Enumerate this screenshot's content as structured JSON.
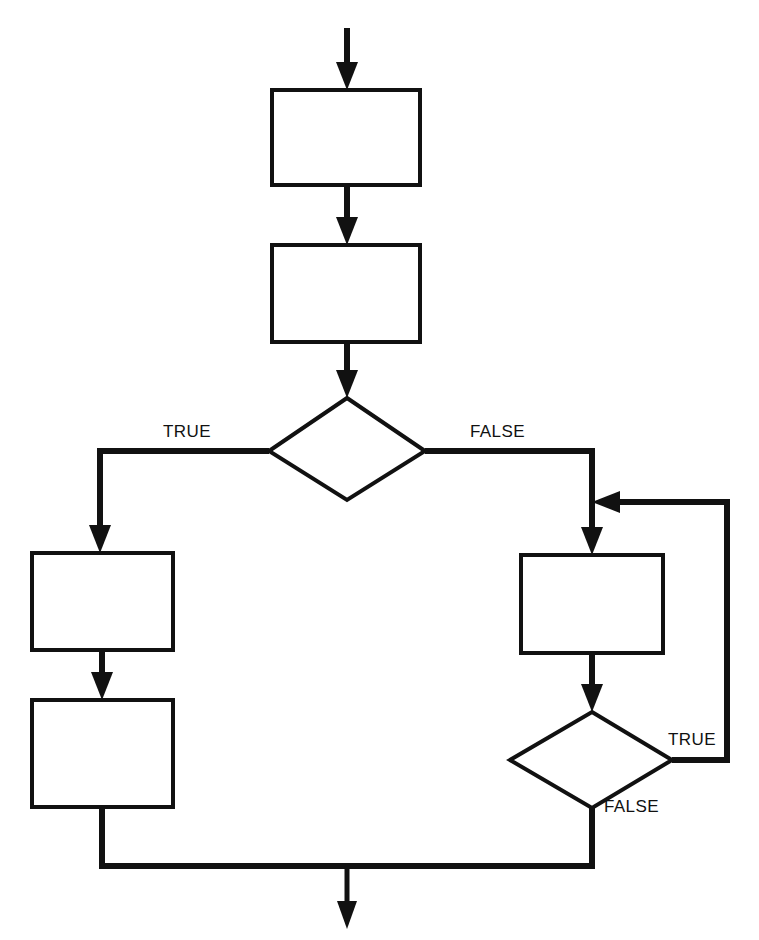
{
  "figure": {
    "kind": "flowchart",
    "title": "",
    "background_color": "#ffffff",
    "stroke_color": "#111111",
    "fill_color": "#ffffff",
    "width": 759,
    "height": 940
  },
  "nodes": [
    {
      "id": "process-1",
      "type": "process",
      "label": "",
      "x": 272,
      "y": 90,
      "w": 148,
      "h": 95
    },
    {
      "id": "process-2",
      "type": "process",
      "label": "",
      "x": 272,
      "y": 245,
      "w": 148,
      "h": 97
    },
    {
      "id": "decision-1",
      "type": "decision",
      "label": "",
      "cx": 347,
      "cy": 451,
      "rx": 78,
      "ry": 49
    },
    {
      "id": "process-3",
      "type": "process",
      "label": "",
      "x": 32,
      "y": 553,
      "w": 141,
      "h": 97
    },
    {
      "id": "process-4",
      "type": "process",
      "label": "",
      "x": 32,
      "y": 700,
      "w": 141,
      "h": 107
    },
    {
      "id": "process-5",
      "type": "process",
      "label": "",
      "x": 521,
      "y": 555,
      "w": 142,
      "h": 98
    },
    {
      "id": "decision-2",
      "type": "decision",
      "label": "",
      "cx": 591,
      "cy": 760,
      "rx": 81,
      "ry": 48
    }
  ],
  "labels": {
    "decision1_true": "TRUE",
    "decision1_false": "FALSE",
    "decision2_true": "TRUE",
    "decision2_false": "FALSE"
  },
  "label_positions": [
    {
      "id": "decision1-true-label",
      "text_key": "decision1_true",
      "x": 163,
      "y": 437,
      "anchor": "start"
    },
    {
      "id": "decision1-false-label",
      "text_key": "decision1_false",
      "x": 470,
      "y": 437,
      "anchor": "start"
    },
    {
      "id": "decision2-true-label",
      "text_key": "decision2_true",
      "x": 668,
      "y": 745,
      "anchor": "start"
    },
    {
      "id": "decision2-false-label",
      "text_key": "decision2_false",
      "x": 604,
      "y": 812,
      "anchor": "start"
    }
  ],
  "edges": [
    {
      "id": "entry-to-process1",
      "from": "entry",
      "to": "process-1",
      "label": "",
      "arrow": true
    },
    {
      "id": "process1-to-process2",
      "from": "process-1",
      "to": "process-2",
      "label": "",
      "arrow": true
    },
    {
      "id": "process2-to-decision1",
      "from": "process-2",
      "to": "decision-1",
      "label": "",
      "arrow": true
    },
    {
      "id": "decision1-true-branch",
      "from": "decision-1",
      "to": "process-3",
      "label": "TRUE",
      "arrow": true
    },
    {
      "id": "decision1-false-branch",
      "from": "decision-1",
      "to": "process-5",
      "label": "FALSE",
      "arrow": true
    },
    {
      "id": "process3-to-process4",
      "from": "process-3",
      "to": "process-4",
      "label": "",
      "arrow": true
    },
    {
      "id": "process5-to-decision2",
      "from": "process-5",
      "to": "decision-2",
      "label": "",
      "arrow": true
    },
    {
      "id": "decision2-true-loop",
      "from": "decision-2",
      "to": "process-5",
      "label": "TRUE",
      "arrow": true
    },
    {
      "id": "decision2-false-exit",
      "from": "decision-2",
      "to": "merge",
      "label": "FALSE",
      "arrow": false
    },
    {
      "id": "process4-to-merge",
      "from": "process-4",
      "to": "merge",
      "label": "",
      "arrow": false
    },
    {
      "id": "merge-to-exit",
      "from": "merge",
      "to": "exit",
      "label": "",
      "arrow": true
    }
  ],
  "top_artifact_text": ""
}
